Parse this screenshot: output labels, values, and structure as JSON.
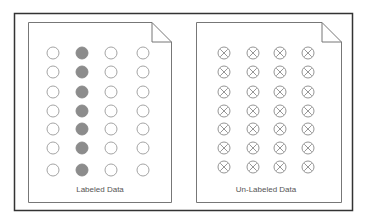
{
  "panels": [
    {
      "id": "labeled",
      "caption": "Labeled Data",
      "grid": {
        "rows": 7,
        "cols": 4,
        "marker": "circle",
        "filled_column": 2
      }
    },
    {
      "id": "unlabeled",
      "caption": "Un-Labeled Data",
      "grid": {
        "rows": 7,
        "cols": 4,
        "marker": "circle-x"
      }
    }
  ],
  "colors": {
    "frame": "#333333",
    "document": "#777777",
    "empty_circle": "#9a9a9a",
    "filled_circle": "#8c8c8c",
    "x_circle": "#8a8a8a"
  },
  "icons": {
    "document": "document-icon",
    "empty": "empty-circle-icon",
    "filled": "filled-circle-icon",
    "crossed": "crossed-circle-icon"
  }
}
